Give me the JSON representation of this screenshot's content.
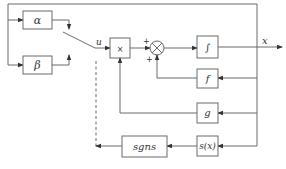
{
  "diagram": {
    "type": "block-diagram",
    "blocks": {
      "alpha": "α",
      "beta": "β",
      "multiplier": "×",
      "integrator": "∫",
      "f": "f",
      "g": "g",
      "sgns": "sgns",
      "sx": "s(x)"
    },
    "signals": {
      "u": "u",
      "x": "x"
    },
    "summing_junction": {
      "sign_top": "+",
      "sign_bottom": "+"
    },
    "colors": {
      "line": "#6b6b6b",
      "text": "#333333"
    }
  }
}
